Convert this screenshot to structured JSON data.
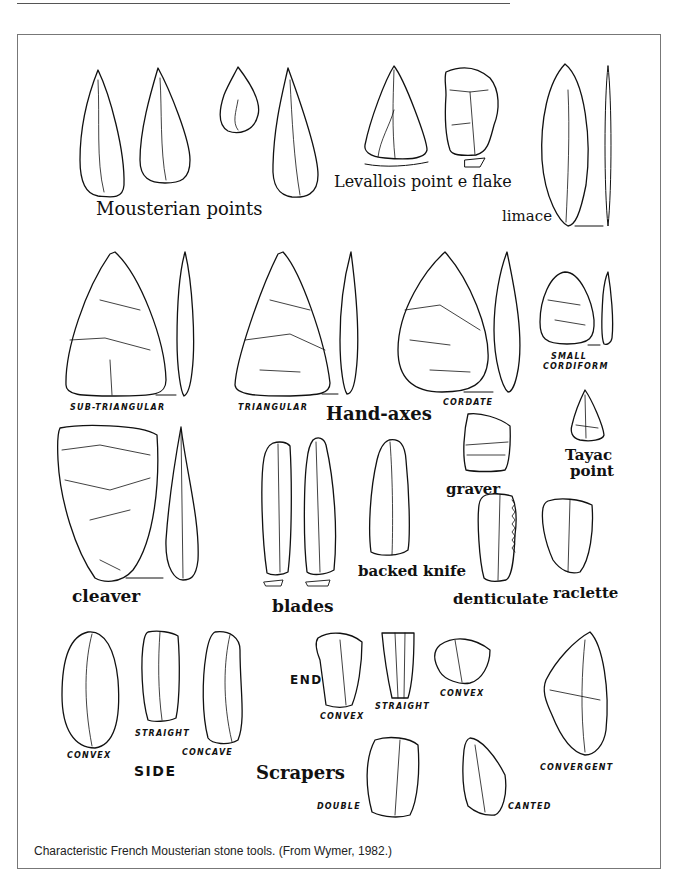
{
  "figure": {
    "caption": "Characteristic French Mousterian stone tools.  (From Wymer, 1982.)",
    "groups": {
      "mousterian_points": "Mousterian points",
      "levallois": "Levallois point e flake",
      "limace": "limace",
      "hand_axes": "Hand-axes",
      "tayac_line1": "Tayac",
      "tayac_line2": "point",
      "graver": "graver",
      "cleaver": "cleaver",
      "blades": "blades",
      "backed_knife": "backed knife",
      "denticulate": "denticulate",
      "raclette": "raclette",
      "scrapers": "Scrapers"
    },
    "hand_axe_types": {
      "sub_triangular": "SUB-TRIANGULAR",
      "triangular": "TRIANGULAR",
      "cordate": "CORDATE",
      "small_line1": "SMALL",
      "small_line2": "CORDIFORM"
    },
    "scraper_types": {
      "side": "SIDE",
      "end": "END",
      "side_convex": "CONVEX",
      "side_straight": "STRAIGHT",
      "side_concave": "CONCAVE",
      "end_convex": "CONVEX",
      "end_straight": "STRAIGHT",
      "end_convex2": "CONVEX",
      "double": "DOUBLE",
      "canted": "CANTED",
      "convergent": "CONVERGENT"
    }
  }
}
